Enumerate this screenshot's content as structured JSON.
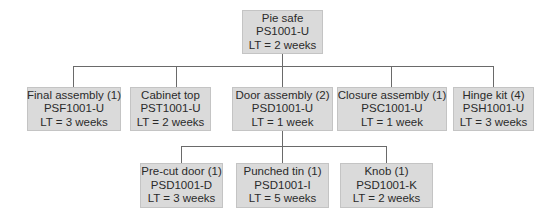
{
  "diagram": {
    "type": "bill-of-materials-tree",
    "root": {
      "name": "Pie safe",
      "part": "PS1001-U",
      "lt": "LT = 2 weeks"
    },
    "level2": [
      {
        "name": "Final assembly (1)",
        "part": "PSF1001-U",
        "lt": "LT = 3 weeks"
      },
      {
        "name": "Cabinet top",
        "part": "PST1001-U",
        "lt": "LT = 2 weeks"
      },
      {
        "name": "Door assembly (2)",
        "part": "PSD1001-U",
        "lt": "LT = 1 week"
      },
      {
        "name": "Closure assembly (1)",
        "part": "PSC1001-U",
        "lt": "LT = 1 week"
      },
      {
        "name": "Hinge kit (4)",
        "part": "PSH1001-U",
        "lt": "LT = 3 weeks"
      }
    ],
    "level3_parent": "Door assembly (2)",
    "level3": [
      {
        "name": "Pre-cut door (1)",
        "part": "PSD1001-D",
        "lt": "LT = 3 weeks"
      },
      {
        "name": "Punched tin (1)",
        "part": "PSD1001-I",
        "lt": "LT = 5 weeks"
      },
      {
        "name": "Knob (1)",
        "part": "PSD1001-K",
        "lt": "LT = 2 weeks"
      }
    ]
  },
  "colors": {
    "node_fill": "#dadada",
    "node_border": "#c4c4c4",
    "connector": "#6a6a6a",
    "text": "#2a2a2a"
  }
}
